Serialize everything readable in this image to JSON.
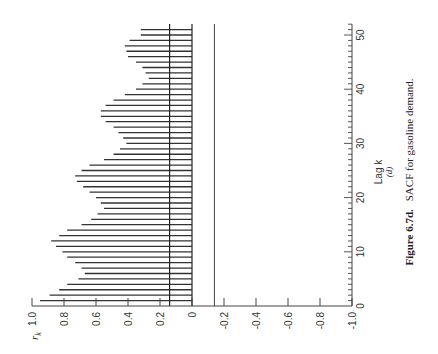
{
  "chart_data": {
    "type": "bar",
    "title": "SACF for gasoline demand.",
    "figure_label": "Figure 6.7d.",
    "panel_label": "(d)",
    "xlabel": "Lag k",
    "ylabel": "r_k",
    "ylabel_main": "r",
    "ylabel_sub": "k",
    "orientation": "rotated 90° (lag axis vertical, r_k axis horizontal)",
    "xlim": [
      0,
      52
    ],
    "ylim": [
      -1.0,
      1.0
    ],
    "x_ticks": [
      0,
      10,
      20,
      30,
      40,
      50
    ],
    "y_ticks": [
      1.0,
      0.8,
      0.6,
      0.4,
      0.2,
      0,
      -0.2,
      -0.4,
      -0.6,
      -0.8,
      -1.0
    ],
    "y_tick_labels": [
      "1.0",
      "0.8",
      "0.6",
      "0.4",
      "0.2",
      "0",
      "-0.2",
      "-0.4",
      "-0.6",
      "-0.8",
      "-1.0"
    ],
    "x_tick_labels": [
      "0",
      "10",
      "20",
      "30",
      "40",
      "50"
    ],
    "confidence_band": [
      -0.14,
      0.14
    ],
    "lags": [
      1,
      2,
      3,
      4,
      5,
      6,
      7,
      8,
      9,
      10,
      11,
      12,
      13,
      14,
      15,
      16,
      17,
      18,
      19,
      20,
      21,
      22,
      23,
      24,
      25,
      26,
      27,
      28,
      29,
      30,
      31,
      32,
      33,
      34,
      35,
      36,
      37,
      38,
      39,
      40,
      41,
      42,
      43,
      44,
      45,
      46,
      47,
      48,
      49,
      50,
      51
    ],
    "values": [
      0.95,
      0.89,
      0.83,
      0.78,
      0.71,
      0.67,
      0.69,
      0.73,
      0.78,
      0.81,
      0.85,
      0.88,
      0.83,
      0.78,
      0.69,
      0.63,
      0.59,
      0.55,
      0.57,
      0.6,
      0.64,
      0.68,
      0.72,
      0.73,
      0.69,
      0.64,
      0.55,
      0.49,
      0.45,
      0.41,
      0.43,
      0.46,
      0.49,
      0.54,
      0.57,
      0.57,
      0.54,
      0.49,
      0.42,
      0.35,
      0.31,
      0.27,
      0.29,
      0.31,
      0.35,
      0.4,
      0.41,
      0.42,
      0.39,
      0.32,
      0.32
    ],
    "grid": false,
    "legend": "none"
  }
}
